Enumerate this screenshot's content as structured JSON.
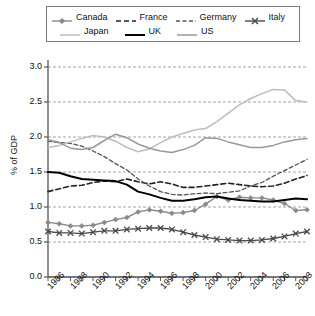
{
  "chart_data": {
    "type": "line",
    "title": "",
    "xlabel": "",
    "ylabel": "% of GDP",
    "ylim": [
      0.0,
      3.0
    ],
    "yticks": [
      0.0,
      0.5,
      1.0,
      1.5,
      2.0,
      2.5,
      3.0
    ],
    "ytick_labels": [
      "0.0",
      "0.5",
      "1.0",
      "1.5",
      "2.0",
      "2.5",
      "3.0"
    ],
    "xlim": [
      1986,
      2009
    ],
    "xticks": [
      1986,
      1987,
      1988,
      1989,
      1990,
      1991,
      1992,
      1993,
      1994,
      1995,
      1996,
      1997,
      1998,
      1999,
      2000,
      2001,
      2002,
      2003,
      2004,
      2005,
      2006,
      2007,
      2008,
      2009
    ],
    "xtick_labels": [
      "1986",
      "1988",
      "1990",
      "1992",
      "1994",
      "1996",
      "1998",
      "2000",
      "2002",
      "2004",
      "2006",
      "2008"
    ],
    "xtick_label_years": [
      1986,
      1988,
      1990,
      1992,
      1994,
      1996,
      1998,
      2000,
      2002,
      2004,
      2006,
      2008
    ],
    "grid": "horizontal-dashed",
    "legend_position": "top",
    "x": [
      1986,
      1987,
      1988,
      1989,
      1990,
      1991,
      1992,
      1993,
      1994,
      1995,
      1996,
      1997,
      1998,
      1999,
      2000,
      2001,
      2002,
      2003,
      2004,
      2005,
      2006,
      2007,
      2008,
      2009
    ],
    "series": [
      {
        "name": "Canada",
        "color": "#8a8a8a",
        "style": "solid-marker",
        "marker": "diamond",
        "width": 1.4,
        "values": [
          0.78,
          0.76,
          0.73,
          0.73,
          0.74,
          0.78,
          0.82,
          0.85,
          0.93,
          0.96,
          0.94,
          0.91,
          0.92,
          0.95,
          1.04,
          1.15,
          1.1,
          1.14,
          1.13,
          1.13,
          1.1,
          1.05,
          0.95,
          0.96
        ]
      },
      {
        "name": "France",
        "color": "#222222",
        "style": "dashed",
        "marker": "none",
        "width": 1.6,
        "values": [
          1.22,
          1.26,
          1.3,
          1.31,
          1.35,
          1.37,
          1.36,
          1.4,
          1.36,
          1.33,
          1.36,
          1.33,
          1.28,
          1.28,
          1.3,
          1.32,
          1.34,
          1.32,
          1.3,
          1.29,
          1.3,
          1.34,
          1.4,
          1.45
        ]
      },
      {
        "name": "Germany",
        "color": "#555555",
        "style": "dashed-fine",
        "marker": "none",
        "width": 1.3,
        "values": [
          1.94,
          1.92,
          1.91,
          1.87,
          1.8,
          1.72,
          1.62,
          1.53,
          1.4,
          1.3,
          1.22,
          1.18,
          1.17,
          1.19,
          1.2,
          1.19,
          1.21,
          1.23,
          1.3,
          1.35,
          1.44,
          1.52,
          1.6,
          1.68
        ]
      },
      {
        "name": "Italy",
        "color": "#4a4a4a",
        "style": "solid-marker",
        "marker": "x",
        "width": 1.3,
        "values": [
          0.65,
          0.63,
          0.63,
          0.62,
          0.64,
          0.66,
          0.66,
          0.68,
          0.69,
          0.7,
          0.7,
          0.68,
          0.64,
          0.6,
          0.57,
          0.54,
          0.53,
          0.52,
          0.52,
          0.53,
          0.55,
          0.58,
          0.62,
          0.65
        ]
      },
      {
        "name": "Japan",
        "color": "#bdbdbd",
        "style": "solid",
        "marker": "none",
        "width": 1.5,
        "values": [
          1.85,
          1.88,
          1.93,
          1.98,
          2.02,
          2.0,
          1.94,
          1.85,
          1.79,
          1.83,
          1.92,
          2.0,
          2.05,
          2.1,
          2.12,
          2.22,
          2.34,
          2.46,
          2.55,
          2.62,
          2.68,
          2.67,
          2.52,
          2.5
        ]
      },
      {
        "name": "UK",
        "color": "#000000",
        "style": "solid",
        "marker": "none",
        "width": 2.0,
        "values": [
          1.5,
          1.49,
          1.44,
          1.4,
          1.39,
          1.38,
          1.37,
          1.32,
          1.22,
          1.18,
          1.13,
          1.09,
          1.09,
          1.11,
          1.14,
          1.15,
          1.12,
          1.1,
          1.09,
          1.08,
          1.08,
          1.1,
          1.12,
          1.11
        ]
      },
      {
        "name": "US",
        "color": "#999999",
        "style": "solid",
        "marker": "none",
        "width": 1.5,
        "values": [
          1.96,
          1.92,
          1.84,
          1.82,
          1.85,
          1.95,
          2.04,
          1.99,
          1.9,
          1.84,
          1.8,
          1.78,
          1.82,
          1.88,
          1.99,
          1.98,
          1.93,
          1.89,
          1.85,
          1.85,
          1.88,
          1.93,
          1.96,
          1.98
        ]
      }
    ]
  },
  "legend": {
    "entries": [
      {
        "label": "Canada"
      },
      {
        "label": "France"
      },
      {
        "label": "Germany"
      },
      {
        "label": "Italy"
      },
      {
        "label": "Japan"
      },
      {
        "label": "UK"
      },
      {
        "label": "US"
      }
    ]
  },
  "axis": {
    "y_title": "% of GDP"
  }
}
